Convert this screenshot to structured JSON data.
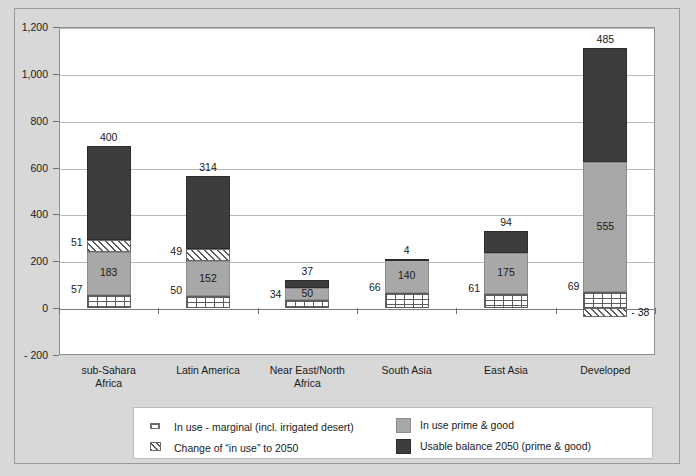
{
  "chart_data": {
    "type": "bar",
    "subtype": "stacked-bar-with-negative",
    "title": "",
    "xlabel": "",
    "ylabel": "",
    "ylim": [
      -200,
      1200
    ],
    "ytick_step": 200,
    "ytick_labels": [
      "1,200",
      "1,000",
      "800",
      "600",
      "400",
      "200",
      "0",
      "- 200"
    ],
    "ytick_values": [
      1200,
      1000,
      800,
      600,
      400,
      200,
      0,
      -200
    ],
    "grid": true,
    "legend_position": "bottom",
    "categories": [
      "sub-Sahara Africa",
      "Latin America",
      "Near East/North Africa",
      "South Asia",
      "East Asia",
      "Developed"
    ],
    "category_lines": [
      [
        "sub-Sahara",
        "Africa"
      ],
      [
        "Latin America",
        ""
      ],
      [
        "Near East/North",
        "Africa"
      ],
      [
        "South Asia",
        ""
      ],
      [
        "East Asia",
        ""
      ],
      [
        "Developed",
        ""
      ]
    ],
    "series": [
      {
        "name": "In use - marginal (incl. irrigated desert)",
        "key": "marginal",
        "pattern": "brick",
        "color": "#ffffff",
        "values": [
          57,
          50,
          34,
          66,
          61,
          69
        ],
        "label_position": "left-outside"
      },
      {
        "name": "In use prime & good",
        "key": "prime",
        "pattern": "solid",
        "color": "#a8a8a8",
        "values": [
          183,
          152,
          50,
          140,
          175,
          555
        ],
        "label_position": "inside"
      },
      {
        "name": "Change of “in use” to 2050",
        "key": "change",
        "pattern": "diagonal-hatch",
        "color": "#ffffff",
        "values": [
          51,
          49,
          0,
          0,
          0,
          -38
        ],
        "label_position": "left-outside"
      },
      {
        "name": "Usable balance 2050 (prime & good)",
        "key": "balance",
        "pattern": "solid",
        "color": "#3d3d3d",
        "values": [
          400,
          314,
          37,
          4,
          94,
          485
        ],
        "label_position": "top-outside"
      }
    ]
  },
  "legend": {
    "items": [
      {
        "label": "In use - marginal (incl. irrigated desert)",
        "swatch": "marginal"
      },
      {
        "label": "In use prime & good",
        "swatch": "prime"
      },
      {
        "label": "Change of “in use” to 2050",
        "swatch": "change"
      },
      {
        "label": "Usable balance 2050 (prime & good)",
        "swatch": "balance"
      }
    ]
  },
  "labels": {
    "y": [
      "1,200",
      "1,000",
      "800",
      "600",
      "400",
      "200",
      "0",
      "- 200"
    ],
    "marginal": [
      "57",
      "50",
      "34",
      "66",
      "61",
      "69"
    ],
    "prime": [
      "183",
      "152",
      "50",
      "140",
      "175",
      "555"
    ],
    "change": [
      "51",
      "49",
      "",
      "",
      "",
      "- 38"
    ],
    "balance": [
      "400",
      "314",
      "37",
      "4",
      "94",
      "485"
    ]
  }
}
